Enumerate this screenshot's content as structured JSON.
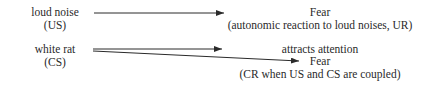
{
  "stimuli": [
    {
      "name": "loud noise",
      "abbr": "(US)"
    },
    {
      "name": "white rat",
      "abbr": "(CS)"
    }
  ],
  "responses": {
    "ur": {
      "title": "Fear",
      "detail": "(autonomic reaction to loud noises, UR)"
    },
    "attention": {
      "title": "attracts attention"
    },
    "cr": {
      "title": "Fear",
      "detail": "(CR when US and CS are coupled)"
    }
  },
  "colors": {
    "line": "#2a2a2a",
    "text": "#2a2a2a"
  }
}
